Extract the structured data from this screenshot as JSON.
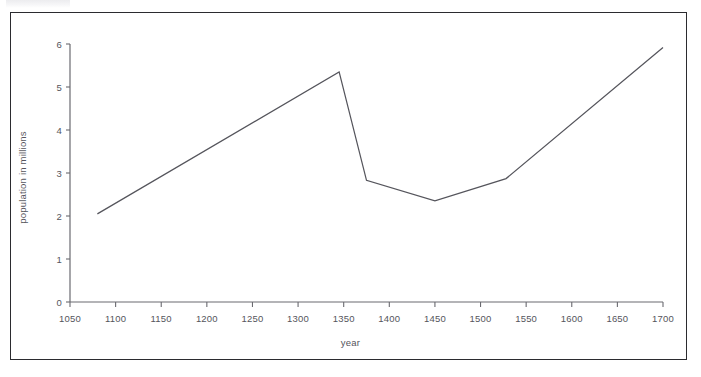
{
  "figure": {
    "border_color": "#2b2b2f",
    "axis_color": "#6a6a70",
    "line_color": "#55555c",
    "text_color": "#55555c",
    "background": "#ffffff"
  },
  "chart_data": {
    "type": "line",
    "title": "",
    "xlabel": "year",
    "ylabel": "population in millions",
    "xlim": [
      1050,
      1700
    ],
    "ylim": [
      0,
      6
    ],
    "grid": false,
    "legend": null,
    "xticks": [
      1050,
      1100,
      1150,
      1200,
      1250,
      1300,
      1350,
      1400,
      1450,
      1500,
      1550,
      1600,
      1650,
      1700
    ],
    "xtick_labels": [
      "1050",
      "1100",
      "1150",
      "1200",
      "1250",
      "1300",
      "1350",
      "1400",
      "1450",
      "1500",
      "1550",
      "1600",
      "1650",
      "1700"
    ],
    "yticks": [
      0,
      1,
      2,
      3,
      4,
      5,
      6
    ],
    "ytick_labels": [
      "0",
      "1",
      "2",
      "3",
      "4",
      "5",
      "6"
    ],
    "series": [
      {
        "name": "population",
        "x": [
          1080,
          1345,
          1375,
          1450,
          1528,
          1700
        ],
        "values": [
          2.05,
          5.35,
          2.83,
          2.35,
          2.87,
          5.92
        ]
      }
    ]
  }
}
